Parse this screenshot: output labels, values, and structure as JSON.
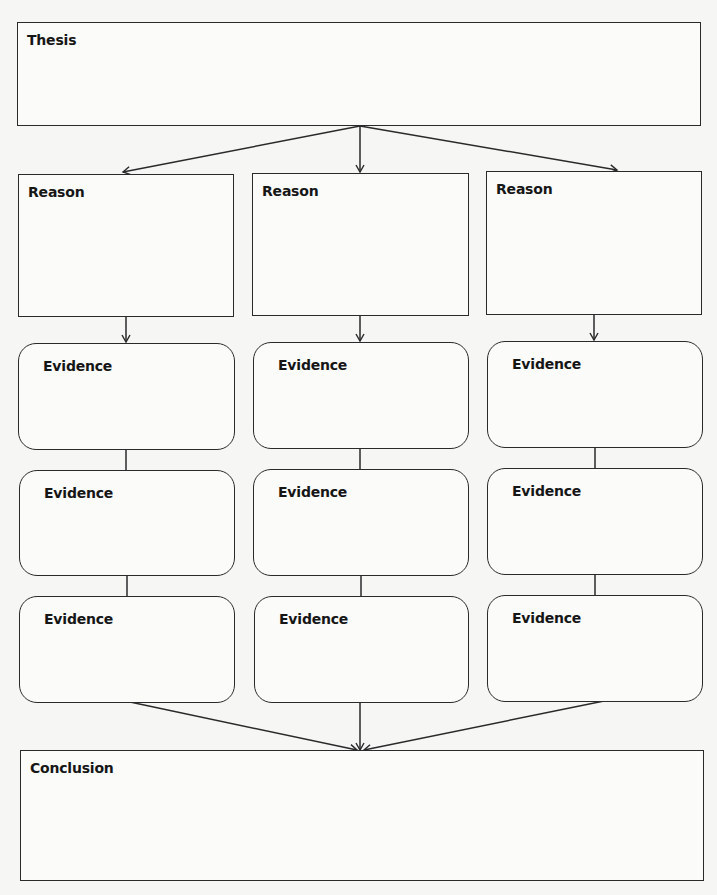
{
  "diagram": {
    "type": "argument-organizer",
    "thesis": {
      "label": "Thesis"
    },
    "columns": [
      {
        "reason": {
          "label": "Reason"
        },
        "evidence": [
          {
            "label": "Evidence"
          },
          {
            "label": "Evidence"
          },
          {
            "label": "Evidence"
          }
        ]
      },
      {
        "reason": {
          "label": "Reason"
        },
        "evidence": [
          {
            "label": "Evidence"
          },
          {
            "label": "Evidence"
          },
          {
            "label": "Evidence"
          }
        ]
      },
      {
        "reason": {
          "label": "Reason"
        },
        "evidence": [
          {
            "label": "Evidence"
          },
          {
            "label": "Evidence"
          },
          {
            "label": "Evidence"
          }
        ]
      }
    ],
    "conclusion": {
      "label": "Conclusion"
    },
    "colors": {
      "stroke": "#2a2a2a",
      "box_fill": "#fbfbfa",
      "background": "#f6f6f5",
      "text": "#161616"
    }
  }
}
